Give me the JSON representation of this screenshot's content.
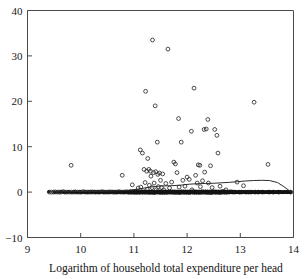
{
  "figure": {
    "clipped_top_text": "",
    "background_color": "#ffffff",
    "axis_color": "#4a4a4a",
    "marker_color": "#2b2b2b",
    "line_color": "#2b2b2b"
  },
  "chart_data": {
    "type": "scatter",
    "title": "",
    "subtitle": "",
    "xlabel": "Logarithm of household total expenditure per head",
    "ylabel": "",
    "xlim": [
      9,
      14
    ],
    "ylim": [
      -10,
      40
    ],
    "xticks": [
      9,
      10,
      11,
      12,
      13,
      14
    ],
    "xtick_labels": [
      "9",
      "10",
      "11",
      "12",
      "13",
      "14"
    ],
    "yticks": [
      -10,
      0,
      10,
      20,
      30,
      40
    ],
    "ytick_labels": [
      "−10",
      "0",
      "10",
      "20",
      "30",
      "40"
    ],
    "grid": false,
    "legend": null,
    "legend_position": "none",
    "marker": "open-circle",
    "marker_size": 3,
    "annotations": [],
    "series": [
      {
        "name": "households",
        "type": "scatter",
        "points": [
          [
            9.41,
            0.0
          ],
          [
            9.45,
            0.0
          ],
          [
            9.49,
            0.0
          ],
          [
            9.52,
            0.05
          ],
          [
            9.56,
            0.0
          ],
          [
            9.6,
            0.0
          ],
          [
            9.63,
            0.0
          ],
          [
            9.67,
            0.1
          ],
          [
            9.7,
            0.0
          ],
          [
            9.74,
            0.0
          ],
          [
            9.78,
            0.0
          ],
          [
            9.82,
            5.9
          ],
          [
            9.83,
            0.0
          ],
          [
            9.87,
            0.0
          ],
          [
            9.9,
            0.05
          ],
          [
            9.94,
            0.0
          ],
          [
            9.98,
            0.0
          ],
          [
            10.01,
            0.0
          ],
          [
            10.05,
            0.1
          ],
          [
            10.08,
            0.0
          ],
          [
            10.12,
            0.0
          ],
          [
            10.15,
            0.0
          ],
          [
            10.19,
            0.0
          ],
          [
            10.22,
            0.05
          ],
          [
            10.26,
            0.0
          ],
          [
            10.29,
            0.0
          ],
          [
            10.33,
            0.0
          ],
          [
            10.36,
            0.0
          ],
          [
            10.4,
            0.1
          ],
          [
            10.43,
            0.0
          ],
          [
            10.46,
            0.0
          ],
          [
            10.5,
            0.0
          ],
          [
            10.53,
            0.0
          ],
          [
            10.56,
            0.05
          ],
          [
            10.6,
            0.0
          ],
          [
            10.63,
            0.0
          ],
          [
            10.66,
            0.0
          ],
          [
            10.69,
            0.0
          ],
          [
            10.72,
            0.1
          ],
          [
            10.75,
            0.0
          ],
          [
            10.78,
            3.7
          ],
          [
            10.79,
            0.0
          ],
          [
            10.82,
            0.0
          ],
          [
            10.85,
            0.05
          ],
          [
            10.88,
            0.0
          ],
          [
            10.91,
            0.0
          ],
          [
            10.94,
            0.0
          ],
          [
            10.97,
            1.6
          ],
          [
            10.99,
            0.0
          ],
          [
            11.02,
            0.0
          ],
          [
            11.04,
            0.0
          ],
          [
            11.06,
            0.05
          ],
          [
            11.08,
            0.9
          ],
          [
            11.1,
            0.0
          ],
          [
            11.12,
            9.3
          ],
          [
            11.13,
            1.1
          ],
          [
            11.15,
            0.0
          ],
          [
            11.16,
            8.6
          ],
          [
            11.17,
            0.0
          ],
          [
            11.19,
            5.0
          ],
          [
            11.2,
            0.0
          ],
          [
            11.21,
            2.1
          ],
          [
            11.22,
            22.2
          ],
          [
            11.23,
            0.0
          ],
          [
            11.24,
            4.6
          ],
          [
            11.25,
            0.6
          ],
          [
            11.26,
            7.4
          ],
          [
            11.27,
            0.0
          ],
          [
            11.28,
            5.0
          ],
          [
            11.29,
            1.5
          ],
          [
            11.3,
            0.0
          ],
          [
            11.31,
            4.6
          ],
          [
            11.32,
            3.5
          ],
          [
            11.33,
            0.0
          ],
          [
            11.34,
            1.0
          ],
          [
            11.35,
            33.5
          ],
          [
            11.36,
            0.0
          ],
          [
            11.37,
            4.3
          ],
          [
            11.38,
            2.0
          ],
          [
            11.39,
            0.0
          ],
          [
            11.4,
            19.0
          ],
          [
            11.41,
            4.5
          ],
          [
            11.42,
            0.5
          ],
          [
            11.43,
            0.0
          ],
          [
            11.44,
            11.0
          ],
          [
            11.45,
            3.9
          ],
          [
            11.46,
            1.2
          ],
          [
            11.47,
            0.0
          ],
          [
            11.48,
            4.2
          ],
          [
            11.49,
            0.0
          ],
          [
            11.5,
            2.6
          ],
          [
            11.51,
            0.0
          ],
          [
            11.52,
            1.0
          ],
          [
            11.53,
            0.0
          ],
          [
            11.54,
            4.0
          ],
          [
            11.55,
            0.0
          ],
          [
            11.56,
            0.5
          ],
          [
            11.58,
            0.0
          ],
          [
            11.6,
            1.9
          ],
          [
            11.62,
            0.0
          ],
          [
            11.64,
            31.5
          ],
          [
            11.65,
            0.0
          ],
          [
            11.67,
            0.9
          ],
          [
            11.69,
            0.0
          ],
          [
            11.71,
            2.2
          ],
          [
            11.73,
            0.0
          ],
          [
            11.75,
            6.6
          ],
          [
            11.76,
            0.0
          ],
          [
            11.78,
            6.2
          ],
          [
            11.79,
            0.0
          ],
          [
            11.81,
            4.3
          ],
          [
            11.82,
            0.0
          ],
          [
            11.84,
            16.2
          ],
          [
            11.85,
            1.1
          ],
          [
            11.87,
            0.0
          ],
          [
            11.89,
            11.0
          ],
          [
            11.9,
            0.0
          ],
          [
            11.92,
            2.6
          ],
          [
            11.94,
            0.0
          ],
          [
            11.96,
            1.3
          ],
          [
            11.98,
            0.0
          ],
          [
            12.0,
            3.3
          ],
          [
            12.02,
            0.0
          ],
          [
            12.04,
            2.8
          ],
          [
            12.06,
            0.0
          ],
          [
            12.08,
            13.4
          ],
          [
            12.09,
            0.5
          ],
          [
            12.11,
            0.0
          ],
          [
            12.13,
            22.9
          ],
          [
            12.14,
            0.0
          ],
          [
            12.16,
            3.7
          ],
          [
            12.17,
            0.0
          ],
          [
            12.19,
            2.0
          ],
          [
            12.21,
            6.0
          ],
          [
            12.22,
            0.0
          ],
          [
            12.24,
            5.9
          ],
          [
            12.25,
            1.2
          ],
          [
            12.27,
            0.0
          ],
          [
            12.29,
            2.5
          ],
          [
            12.3,
            0.0
          ],
          [
            12.32,
            13.8
          ],
          [
            12.33,
            4.4
          ],
          [
            12.35,
            0.0
          ],
          [
            12.36,
            13.9
          ],
          [
            12.38,
            0.0
          ],
          [
            12.39,
            16.0
          ],
          [
            12.4,
            2.0
          ],
          [
            12.42,
            0.0
          ],
          [
            12.44,
            5.8
          ],
          [
            12.45,
            0.0
          ],
          [
            12.47,
            1.0
          ],
          [
            12.49,
            0.0
          ],
          [
            12.52,
            13.8
          ],
          [
            12.54,
            0.0
          ],
          [
            12.56,
            12.5
          ],
          [
            12.58,
            8.6
          ],
          [
            12.6,
            0.0
          ],
          [
            12.62,
            1.3
          ],
          [
            12.64,
            0.0
          ],
          [
            12.67,
            0.1
          ],
          [
            12.7,
            0.0
          ],
          [
            12.73,
            0.5
          ],
          [
            12.76,
            0.0
          ],
          [
            12.79,
            0.0
          ],
          [
            12.82,
            0.1
          ],
          [
            12.86,
            0.0
          ],
          [
            12.9,
            0.0
          ],
          [
            12.94,
            2.2
          ],
          [
            12.98,
            0.0
          ],
          [
            13.02,
            0.0
          ],
          [
            13.06,
            1.4
          ],
          [
            13.1,
            0.0
          ],
          [
            13.15,
            0.0
          ],
          [
            13.2,
            0.0
          ],
          [
            13.26,
            19.8
          ],
          [
            13.28,
            0.0
          ],
          [
            13.34,
            0.0
          ],
          [
            13.42,
            0.0
          ],
          [
            13.52,
            6.1
          ],
          [
            13.54,
            0.0
          ],
          [
            13.62,
            0.0
          ],
          [
            13.72,
            0.0
          ],
          [
            13.95,
            0.0
          ]
        ]
      },
      {
        "name": "smoothed-fit",
        "type": "line",
        "points": [
          [
            9.4,
            0.05
          ],
          [
            9.8,
            0.1
          ],
          [
            10.2,
            0.15
          ],
          [
            10.6,
            0.25
          ],
          [
            10.9,
            0.4
          ],
          [
            11.1,
            0.7
          ],
          [
            11.3,
            1.1
          ],
          [
            11.5,
            1.35
          ],
          [
            11.7,
            1.4
          ],
          [
            11.9,
            1.55
          ],
          [
            12.05,
            1.75
          ],
          [
            12.2,
            1.85
          ],
          [
            12.35,
            1.9
          ],
          [
            12.5,
            1.95
          ],
          [
            12.65,
            2.05
          ],
          [
            12.8,
            2.15
          ],
          [
            12.95,
            2.3
          ],
          [
            13.1,
            2.45
          ],
          [
            13.25,
            2.55
          ],
          [
            13.4,
            2.6
          ],
          [
            13.55,
            2.55
          ],
          [
            13.7,
            2.1
          ],
          [
            13.82,
            1.2
          ],
          [
            13.95,
            0.05
          ]
        ]
      }
    ]
  }
}
